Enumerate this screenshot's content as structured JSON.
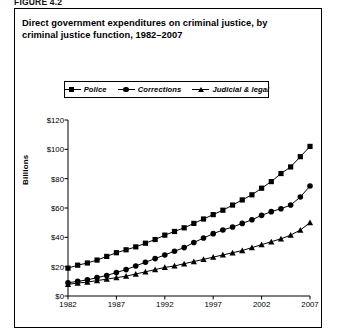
{
  "figure_label": "FIGURE 4.2",
  "chart_data": {
    "type": "line",
    "title": "Direct government expenditures on criminal justice, by criminal justice function, 1982–2007",
    "title_line1": "Direct government expenditures on criminal justice, by",
    "title_line2": "criminal justice function, 1982–2007",
    "xlabel": "",
    "ylabel": "Billions",
    "xlim": [
      1982,
      2007
    ],
    "ylim": [
      0,
      120
    ],
    "grid": false,
    "legend_position": "top-center",
    "y_tick_labels": [
      "$120",
      "$100",
      "$80",
      "$60",
      "$40",
      "$20",
      "$0"
    ],
    "y_tick_values": [
      120,
      100,
      80,
      60,
      40,
      20,
      0
    ],
    "x_tick_labels": [
      "1982",
      "1987",
      "1992",
      "1997",
      "2002",
      "2007"
    ],
    "x_tick_values": [
      1982,
      1987,
      1992,
      1997,
      2002,
      2007
    ],
    "x": [
      1982,
      1983,
      1984,
      1985,
      1986,
      1987,
      1988,
      1989,
      1990,
      1991,
      1992,
      1993,
      1994,
      1995,
      1996,
      1997,
      1998,
      1999,
      2000,
      2001,
      2002,
      2003,
      2004,
      2005,
      2006,
      2007
    ],
    "series": [
      {
        "name": "Police",
        "marker": "square",
        "values": [
          19.0,
          21.0,
          22.5,
          24.5,
          27.0,
          29.5,
          31.5,
          33.5,
          36.0,
          38.5,
          41.5,
          44.0,
          46.5,
          49.5,
          52.5,
          55.5,
          58.5,
          62.0,
          65.5,
          69.0,
          73.5,
          78.0,
          83.5,
          88.0,
          95.0,
          102.0
        ]
      },
      {
        "name": "Corrections",
        "marker": "circle",
        "values": [
          9.0,
          10.0,
          11.0,
          12.5,
          14.0,
          16.0,
          18.0,
          20.5,
          23.0,
          25.5,
          28.0,
          30.5,
          33.0,
          36.5,
          39.5,
          42.5,
          45.0,
          47.0,
          49.5,
          52.0,
          55.0,
          57.5,
          59.5,
          62.0,
          67.5,
          75.0
        ]
      },
      {
        "name": "Judicial & legal",
        "marker": "triangle",
        "values": [
          8.0,
          8.8,
          9.5,
          10.5,
          11.5,
          12.5,
          13.5,
          15.0,
          16.5,
          18.0,
          19.5,
          20.5,
          22.0,
          23.5,
          25.0,
          26.5,
          28.0,
          29.5,
          31.0,
          33.0,
          35.0,
          37.0,
          39.0,
          41.5,
          45.0,
          50.0
        ]
      }
    ]
  }
}
